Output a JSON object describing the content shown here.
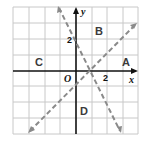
{
  "figure": {
    "type": "coordinate-plane",
    "axes": {
      "x_label": "x",
      "y_label": "y",
      "origin_label": "O",
      "x_tick_label": "2",
      "y_tick_label": "2",
      "range": {
        "x": [
          -4,
          4
        ],
        "y": [
          -4,
          4
        ]
      },
      "grid": true
    },
    "lines": [
      {
        "name": "line-1",
        "equation": "y = -2x + 2",
        "style": "dashed",
        "color": "#8a8a8a"
      },
      {
        "name": "line-2",
        "equation": "y = x - 1",
        "style": "dashed",
        "color": "#8a8a8a"
      }
    ],
    "regions": [
      {
        "label": "A"
      },
      {
        "label": "B"
      },
      {
        "label": "C"
      },
      {
        "label": "D"
      }
    ],
    "colors": {
      "grid": "#c8c8c8",
      "axis": "#111111",
      "dashed_lines": "#8a8a8a",
      "region_labels": "#3a3a3a"
    }
  }
}
